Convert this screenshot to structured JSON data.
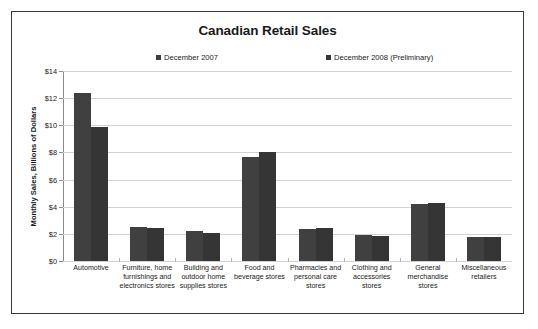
{
  "chart_data": {
    "type": "bar",
    "title": "Canadian Retail Sales",
    "xlabel": "",
    "ylabel": "Monthly Sales, Billions of Dollars",
    "ylim": [
      0,
      14
    ],
    "ytick_labels": [
      "$0",
      "$2",
      "$4",
      "$6",
      "$8",
      "$10",
      "$12",
      "$14"
    ],
    "ytick_values": [
      0,
      2,
      4,
      6,
      8,
      10,
      12,
      14
    ],
    "grid": true,
    "legend_position": "top",
    "categories": [
      "Automotive",
      "Furniture, home furnishings and electronics stores",
      "Building and outdoor home supplies stores",
      "Food and beverage stores",
      "Pharmacies and personal care stores",
      "Clothing and accessories stores",
      "General merchandise stores",
      "Miscellaneous retailers"
    ],
    "series": [
      {
        "name": "December 2007",
        "color": "#404040",
        "values": [
          12.4,
          2.5,
          2.2,
          7.7,
          2.35,
          1.95,
          4.2,
          1.8
        ]
      },
      {
        "name": "December 2008 (Preliminary)",
        "color": "#353535",
        "values": [
          9.85,
          2.45,
          2.1,
          8.05,
          2.45,
          1.85,
          4.3,
          1.75
        ]
      }
    ]
  },
  "chart": {
    "title": "Canadian Retail Sales",
    "y_axis_title": "Monthly Sales, Billions of Dollars"
  },
  "legend": {
    "entries": [
      {
        "label": "December 2007",
        "color": "#404040"
      },
      {
        "label": "December 2008 (Preliminary)",
        "color": "#353535"
      }
    ]
  }
}
